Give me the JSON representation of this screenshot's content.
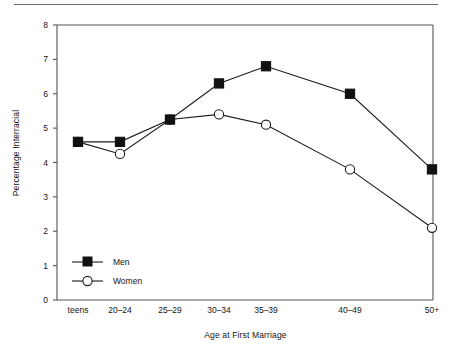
{
  "chart_data": {
    "type": "line",
    "title": "",
    "xlabel": "Age at First Marriage",
    "ylabel": "Percentage Interracial",
    "categories": [
      "teens",
      "20–24",
      "25–29",
      "30–34",
      "35–39",
      "40–49",
      "50+"
    ],
    "category_positions": [
      78,
      120,
      170,
      219,
      266,
      350,
      432
    ],
    "series": [
      {
        "name": "Men",
        "marker": "filled-square",
        "values": [
          4.6,
          4.6,
          5.25,
          6.3,
          6.8,
          6.0,
          3.8
        ]
      },
      {
        "name": "Women",
        "marker": "open-circle",
        "values": [
          4.6,
          4.25,
          5.25,
          5.4,
          5.1,
          3.8,
          2.1
        ]
      }
    ],
    "ylim": [
      0,
      8
    ],
    "yticks": [
      0,
      1,
      2,
      3,
      4,
      5,
      6,
      7,
      8
    ],
    "ytick_labels": [
      "0",
      "1",
      "2",
      "3",
      "4",
      "5",
      "6",
      "7",
      "8"
    ],
    "grid": false,
    "legend_position": "inside-lower-left",
    "line_color": "#1a1a1a",
    "marker_fill_men": "#111111",
    "marker_fill_women": "#ffffff",
    "axis_color": "#555555"
  },
  "legend": {
    "entries": [
      {
        "label": "Men"
      },
      {
        "label": "Women"
      }
    ]
  }
}
